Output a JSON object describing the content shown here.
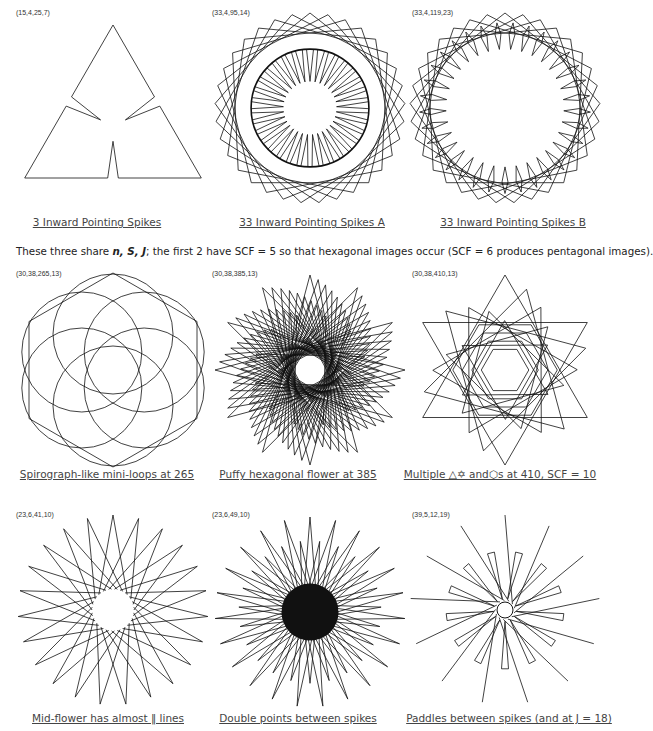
{
  "figures": [
    {
      "id": "f1",
      "params": "(15,4,25,7)",
      "caption": "3 Inward Pointing Spikes",
      "cx": 113,
      "cy": 115,
      "r": 100,
      "n": 15,
      "s": 4,
      "j": 25,
      "k": 7
    },
    {
      "id": "f2",
      "params": "(33,4,95,14)",
      "caption": "33 Inward Pointing Spikes A",
      "cx": 310,
      "cy": 108,
      "r": 95,
      "n": 33,
      "s": 4,
      "j": 95,
      "k": 14
    },
    {
      "id": "f3",
      "params": "(33,4,119,23)",
      "caption": "33 Inward Pointing Spikes B",
      "cx": 505,
      "cy": 108,
      "r": 95,
      "n": 33,
      "s": 4,
      "j": 119,
      "k": 23
    },
    {
      "id": "f4",
      "params": "(30,38,265,13)",
      "caption": "Spirograph-like mini-loops at 265",
      "cx": 113,
      "cy": 370,
      "r": 95,
      "n": 30,
      "s": 38,
      "j": 265,
      "k": 13
    },
    {
      "id": "f5",
      "params": "(30,38,385,13)",
      "caption": "Puffy hexagonal flower at 385",
      "cx": 310,
      "cy": 370,
      "r": 95,
      "n": 30,
      "s": 38,
      "j": 385,
      "k": 13
    },
    {
      "id": "f6",
      "params": "(30,38,410,13)",
      "caption": "Multiple △✡ and⬡s at 410, SCF = 10",
      "cx": 505,
      "cy": 370,
      "r": 95,
      "n": 30,
      "s": 38,
      "j": 410,
      "k": 13
    },
    {
      "id": "f7",
      "params": "(23,6,41,10)",
      "caption": "Mid-flower has almost ‖ lines",
      "cx": 113,
      "cy": 610,
      "r": 95,
      "n": 23,
      "s": 6,
      "j": 41,
      "k": 10
    },
    {
      "id": "f8",
      "params": "(23,6,49,10)",
      "caption": "Double points between spikes",
      "cx": 310,
      "cy": 612,
      "r": 95,
      "n": 23,
      "s": 6,
      "j": 49,
      "k": 10
    },
    {
      "id": "f9",
      "params": "(39,5,12,19)",
      "caption": "Paddles between spikes (and at J = 18)",
      "cx": 505,
      "cy": 610,
      "r": 95,
      "n": 39,
      "s": 5,
      "j": 12,
      "k": 19
    }
  ],
  "note": {
    "pre": "These three share ",
    "vars": "n, S, J",
    "post": "; the first 2 have SCF = 5 so that hexagonal images occur (SCF = 6 produces pentagonal images)."
  }
}
